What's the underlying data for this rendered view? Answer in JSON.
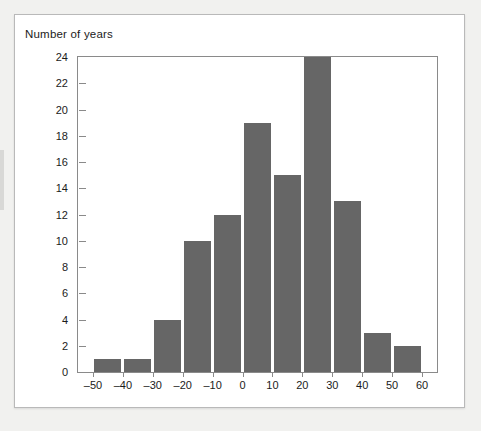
{
  "chart_data": {
    "type": "bar",
    "title": "Number of years",
    "subtitle": "",
    "xlabel": "",
    "ylabel": "Number of years",
    "legend": [],
    "legend_position": "none",
    "grid": false,
    "xlim": [
      -55,
      65
    ],
    "ylim": [
      0,
      24
    ],
    "xticks": [
      "–50",
      "–40",
      "–30",
      "–20",
      "–10",
      "0",
      "10",
      "20",
      "30",
      "40",
      "50",
      "60"
    ],
    "xtick_values": [
      -50,
      -40,
      -30,
      -20,
      -10,
      0,
      10,
      20,
      30,
      40,
      50,
      60
    ],
    "yticks": [
      "0",
      "2",
      "4",
      "6",
      "8",
      "10",
      "12",
      "14",
      "16",
      "18",
      "20",
      "22",
      "24"
    ],
    "ytick_values": [
      0,
      2,
      4,
      6,
      8,
      10,
      12,
      14,
      16,
      18,
      20,
      22,
      24
    ],
    "bin_width": 10,
    "bin_starts": [
      -50,
      -40,
      -30,
      -20,
      -10,
      0,
      10,
      20,
      30,
      40,
      50
    ],
    "categories": [
      "–50 to –40",
      "–40 to –30",
      "–30 to –20",
      "–20 to –10",
      "–10 to 0",
      "0 to 10",
      "10 to 20",
      "20 to 30",
      "30 to 40",
      "40 to 50",
      "50 to 60"
    ],
    "values": [
      1,
      1,
      4,
      10,
      12,
      19,
      15,
      24,
      13,
      3,
      2
    ],
    "bar_color": "#666666",
    "axis_color": "#8a8a8a",
    "text_color": "#1b1b1b",
    "plot_background": "#ffffff",
    "card_background": "#ffffff",
    "page_background": "#f1f1ef"
  }
}
